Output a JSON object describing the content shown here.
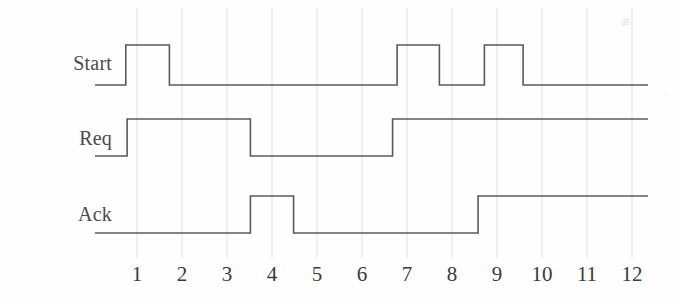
{
  "figure": {
    "kind": "timing-diagram",
    "background_color": "#fefefe",
    "waveform_color": "#5a5a5a",
    "grid_color": "#e2e2e2",
    "label_color": "#4a4a4a"
  },
  "axis": {
    "tick_labels": [
      "1",
      "2",
      "3",
      "4",
      "5",
      "6",
      "7",
      "8",
      "9",
      "10",
      "11",
      "12"
    ],
    "tick_values": [
      1,
      2,
      3,
      4,
      5,
      6,
      7,
      8,
      9,
      10,
      11,
      12
    ],
    "x_start_value": 0.05,
    "x_end_value": 12.4,
    "px_per_unit": 45,
    "x_of_tick_one_px": 137,
    "trace_left_px": 95,
    "trace_right_px": 648
  },
  "signals": [
    {
      "name": "Start",
      "label": "Start",
      "label_x_px": 30,
      "label_y_px": 62,
      "low_y_px": 85,
      "high_y_px": 45,
      "initial_level": 0,
      "transitions": [
        {
          "t": 0.75,
          "level": 1
        },
        {
          "t": 1.72,
          "level": 0
        },
        {
          "t": 6.78,
          "level": 1
        },
        {
          "t": 7.72,
          "level": 0
        },
        {
          "t": 8.72,
          "level": 1
        },
        {
          "t": 9.58,
          "level": 0
        }
      ]
    },
    {
      "name": "Req",
      "label": "Req",
      "label_x_px": 43,
      "label_y_px": 137,
      "low_y_px": 156,
      "high_y_px": 119,
      "initial_level": 0,
      "transitions": [
        {
          "t": 0.78,
          "level": 1
        },
        {
          "t": 3.52,
          "level": 0
        },
        {
          "t": 6.68,
          "level": 1
        }
      ]
    },
    {
      "name": "Ack",
      "label": "Ack",
      "label_x_px": 42,
      "label_y_px": 213,
      "low_y_px": 233,
      "high_y_px": 196,
      "initial_level": 0,
      "transitions": [
        {
          "t": 3.52,
          "level": 1
        },
        {
          "t": 4.48,
          "level": 0
        },
        {
          "t": 8.58,
          "level": 1
        }
      ]
    }
  ],
  "chart_data": {
    "type": "line",
    "title": "",
    "xlabel": "",
    "ylabel": "",
    "categories": [
      "1",
      "2",
      "3",
      "4",
      "5",
      "6",
      "7",
      "8",
      "9",
      "10",
      "11",
      "12"
    ],
    "series": [
      {
        "name": "Start",
        "waveform": "0 at 0.05; 1 at 0.75; 0 at 1.72; 1 at 6.78; 0 at 7.72; 1 at 8.72; 0 at 9.58",
        "values": [
          1,
          0,
          0,
          0,
          0,
          0,
          1,
          0,
          1,
          0,
          0,
          0
        ]
      },
      {
        "name": "Req",
        "waveform": "0 at 0.05; 1 at 0.78; 0 at 3.52; 1 at 6.68",
        "values": [
          1,
          1,
          1,
          0,
          0,
          0,
          1,
          1,
          1,
          1,
          1,
          1
        ]
      },
      {
        "name": "Ack",
        "waveform": "0 at 0.05; 1 at 3.52; 0 at 4.48; 1 at 8.58",
        "values": [
          0,
          0,
          0,
          1,
          0,
          0,
          0,
          0,
          1,
          1,
          1,
          1
        ]
      }
    ],
    "xlim": [
      0.05,
      12.4
    ],
    "grid": true,
    "legend": "none"
  }
}
